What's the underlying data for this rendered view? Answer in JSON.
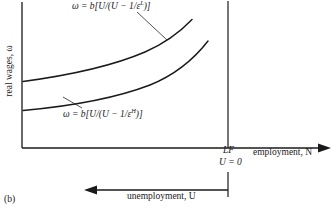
{
  "figure": {
    "caption": "(b)",
    "axes": {
      "y_label": "real wages, ω",
      "x_label": "employment, N",
      "full_employment_marker": "LF",
      "zero_unemployment_marker": "U = 0",
      "unemployment_axis_label": "unemployment, U"
    },
    "curves": [
      {
        "name": "wage-curve-low-elasticity",
        "equation_text": "ω = b[U/(U − 1/ε",
        "equation_superscript": "L",
        "equation_tail": ")]",
        "position": "upper"
      },
      {
        "name": "wage-curve-high-elasticity",
        "equation_text": "ω = b[U/(U − 1/ε",
        "equation_superscript": "H",
        "equation_tail": ")]",
        "position": "lower"
      }
    ],
    "colors": {
      "line": "#1a1a1a",
      "background": "#ffffff",
      "text": "#1a1a1a"
    }
  }
}
